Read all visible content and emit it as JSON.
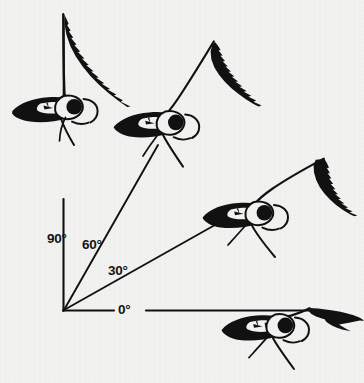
{
  "figure": {
    "kind": "scientific-illustration",
    "background_color": "#f3f3f1",
    "ink_color": "#111111",
    "axis": {
      "vertex": {
        "x": 63,
        "y": 311
      },
      "vertical_arm": {
        "from": {
          "x": 63,
          "y": 311
        },
        "to": {
          "x": 63,
          "y": 14
        }
      },
      "horizontal_arm": {
        "from": {
          "x": 63,
          "y": 311
        },
        "to": {
          "x": 352,
          "y": 311
        }
      }
    },
    "angle_labels": [
      {
        "id": "deg90",
        "text": "90°",
        "value": 90,
        "x": 47,
        "y": 232
      },
      {
        "id": "deg60",
        "text": "60°",
        "value": 60,
        "x": 82,
        "y": 238
      },
      {
        "id": "deg30",
        "text": "30°",
        "value": 30,
        "x": 108,
        "y": 264
      },
      {
        "id": "deg0",
        "text": "0°",
        "value": 0,
        "x": 118,
        "y": 303
      }
    ],
    "rays": [
      {
        "id": "ray90",
        "angle": 90,
        "from": {
          "x": 63,
          "y": 311
        },
        "to": {
          "x": 63,
          "y": 14
        }
      },
      {
        "id": "ray60",
        "angle": 60,
        "from": {
          "x": 63,
          "y": 311
        },
        "to": {
          "x": 158,
          "y": 145
        }
      },
      {
        "id": "ray30",
        "angle": 30,
        "from": {
          "x": 63,
          "y": 311
        },
        "to": {
          "x": 238,
          "y": 211
        }
      },
      {
        "id": "ray0",
        "angle": 0,
        "from": {
          "x": 63,
          "y": 311
        },
        "to": {
          "x": 352,
          "y": 311
        }
      }
    ],
    "birds": [
      {
        "id": "bird-90",
        "wing_angle": 90,
        "head_center": {
          "x": 74,
          "y": 107
        },
        "label": "90°"
      },
      {
        "id": "bird-60",
        "wing_angle": 60,
        "head_center": {
          "x": 175,
          "y": 122
        },
        "label": "60°"
      },
      {
        "id": "bird-30",
        "wing_angle": 30,
        "head_center": {
          "x": 264,
          "y": 213
        },
        "label": "30°"
      },
      {
        "id": "bird-0",
        "wing_angle": 0,
        "head_center": {
          "x": 285,
          "y": 325
        },
        "label": "0°"
      }
    ]
  }
}
